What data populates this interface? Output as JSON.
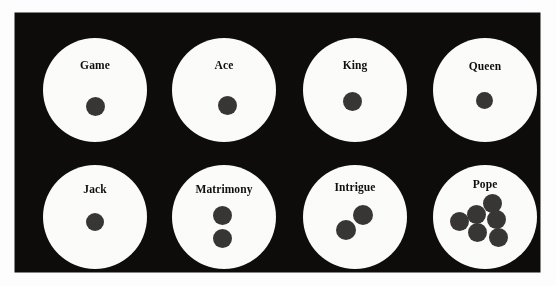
{
  "figure": {
    "kind": "pope-joan-board",
    "board_color": "#0d0c0b",
    "compartment_color": "#fbfbfa",
    "counter_color": "#383634",
    "compartments": [
      {
        "id": "game",
        "label": "Game",
        "counters": 1,
        "row": 1,
        "col": 1
      },
      {
        "id": "ace",
        "label": "Ace",
        "counters": 1,
        "row": 1,
        "col": 2
      },
      {
        "id": "king",
        "label": "King",
        "counters": 1,
        "row": 1,
        "col": 3
      },
      {
        "id": "queen",
        "label": "Queen",
        "counters": 1,
        "row": 1,
        "col": 4
      },
      {
        "id": "jack",
        "label": "Jack",
        "counters": 1,
        "row": 2,
        "col": 1
      },
      {
        "id": "matrimony",
        "label": "Matrimony",
        "counters": 2,
        "row": 2,
        "col": 2
      },
      {
        "id": "intrigue",
        "label": "Intrigue",
        "counters": 2,
        "row": 2,
        "col": 3
      },
      {
        "id": "pope",
        "label": "Pope",
        "counters": 6,
        "row": 2,
        "col": 4
      }
    ]
  }
}
